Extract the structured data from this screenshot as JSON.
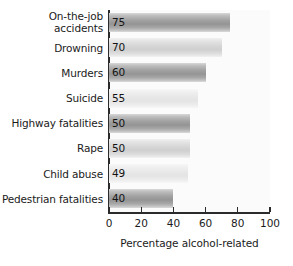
{
  "chart_data": {
    "type": "bar",
    "orientation": "horizontal",
    "title": "",
    "xlabel": "Percentage alcohol-related",
    "ylabel": "",
    "xlim": [
      0,
      100
    ],
    "xticks": [
      0,
      20,
      40,
      60,
      80,
      100
    ],
    "grid": false,
    "legend": null,
    "categories": [
      "On-the-job accidents",
      "Drowning",
      "Murders",
      "Suicide",
      "Highway fatalities",
      "Rape",
      "Child abuse",
      "Pedestrian fatalities"
    ],
    "values": [
      75,
      70,
      60,
      55,
      50,
      50,
      49,
      40
    ],
    "data_labels": [
      "75",
      "70",
      "60",
      "55",
      "50",
      "50",
      "49",
      "40"
    ],
    "bars": [
      {
        "label_line1": "On-the-job",
        "label_line2": "accidents",
        "value": 75,
        "value_label": "75",
        "shade": "dark"
      },
      {
        "label_line1": "Drowning",
        "label_line2": "",
        "value": 70,
        "value_label": "70",
        "shade": "light"
      },
      {
        "label_line1": "Murders",
        "label_line2": "",
        "value": 60,
        "value_label": "60",
        "shade": "dark"
      },
      {
        "label_line1": "Suicide",
        "label_line2": "",
        "value": 55,
        "value_label": "55",
        "shade": "pale"
      },
      {
        "label_line1": "Highway fatalities",
        "label_line2": "",
        "value": 50,
        "value_label": "50",
        "shade": "dark"
      },
      {
        "label_line1": "Rape",
        "label_line2": "",
        "value": 50,
        "value_label": "50",
        "shade": "light"
      },
      {
        "label_line1": "Child abuse",
        "label_line2": "",
        "value": 49,
        "value_label": "49",
        "shade": "pale"
      },
      {
        "label_line1": "Pedestrian fatalities",
        "label_line2": "",
        "value": 40,
        "value_label": "40",
        "shade": "dark"
      }
    ],
    "xtick_labels": [
      "0",
      "20",
      "40",
      "60",
      "80",
      "100"
    ],
    "colors": {
      "bar_dark": "#a2a2a2",
      "bar_light": "#d6d6d6",
      "bar_pale": "#e7e7e7",
      "axis": "#2b2b2b",
      "text": "#1b1b1b",
      "background": "#ffffff",
      "plot_background": "#fbfbfb"
    }
  }
}
